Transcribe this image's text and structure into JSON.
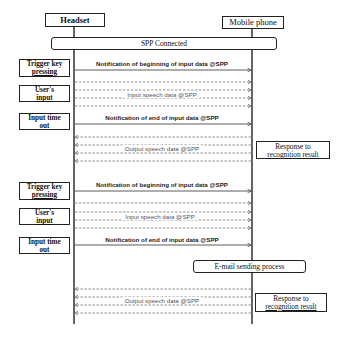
{
  "actors": {
    "headset": "Headset",
    "mobile_phone": "Mobile phone"
  },
  "connection": "SPP Connected",
  "blocks": [
    {
      "events": {
        "trigger": [
          "Trigger key",
          "pressing"
        ],
        "user_input": [
          "User's",
          "input"
        ],
        "timeout": [
          "Input time",
          "out"
        ]
      },
      "messages": {
        "begin": "Notification of beginning of input data @SPP",
        "input_speech": "Input speech data @SPP",
        "end": "Notification of end of input data @SPP",
        "output_speech": "Output speech data @SPP"
      },
      "response": [
        "Response to",
        "recognition result"
      ]
    },
    {
      "events": {
        "trigger": [
          "Trigger key",
          "pressing"
        ],
        "user_input": [
          "User's",
          "input"
        ],
        "timeout": [
          "Input time",
          "out"
        ]
      },
      "messages": {
        "begin": "Notification of beginning of input data @SPP",
        "input_speech": "Input speech data @SPP",
        "end": "Notification of end of input data @SPP",
        "output_speech": "Output speech data @SPP"
      },
      "process": "E-mail sending process",
      "response": [
        "Response to",
        "recognition result"
      ]
    }
  ],
  "colors": {
    "line": "#222222",
    "dashed": "#555555",
    "background": "#ffffff"
  }
}
